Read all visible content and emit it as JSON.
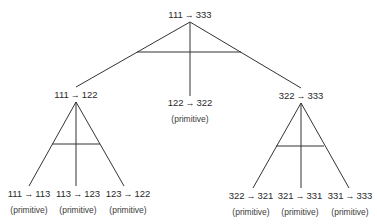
{
  "diagram": {
    "root": {
      "from": "111",
      "to": "333"
    },
    "level1": [
      {
        "from": "111",
        "to": "122",
        "tag": ""
      },
      {
        "from": "122",
        "to": "322",
        "tag": "(primitive)"
      },
      {
        "from": "322",
        "to": "333",
        "tag": ""
      }
    ],
    "level2": [
      {
        "from": "111",
        "to": "113",
        "tag": "(primitive)"
      },
      {
        "from": "113",
        "to": "123",
        "tag": "(primitive)"
      },
      {
        "from": "123",
        "to": "122",
        "tag": "(primitive)"
      },
      {
        "from": "322",
        "to": "321",
        "tag": "(primitive)"
      },
      {
        "from": "321",
        "to": "331",
        "tag": "(primitive)"
      },
      {
        "from": "331",
        "to": "333",
        "tag": "(primitive)"
      }
    ],
    "arrow_glyph": "→",
    "line_color": "#333333"
  }
}
